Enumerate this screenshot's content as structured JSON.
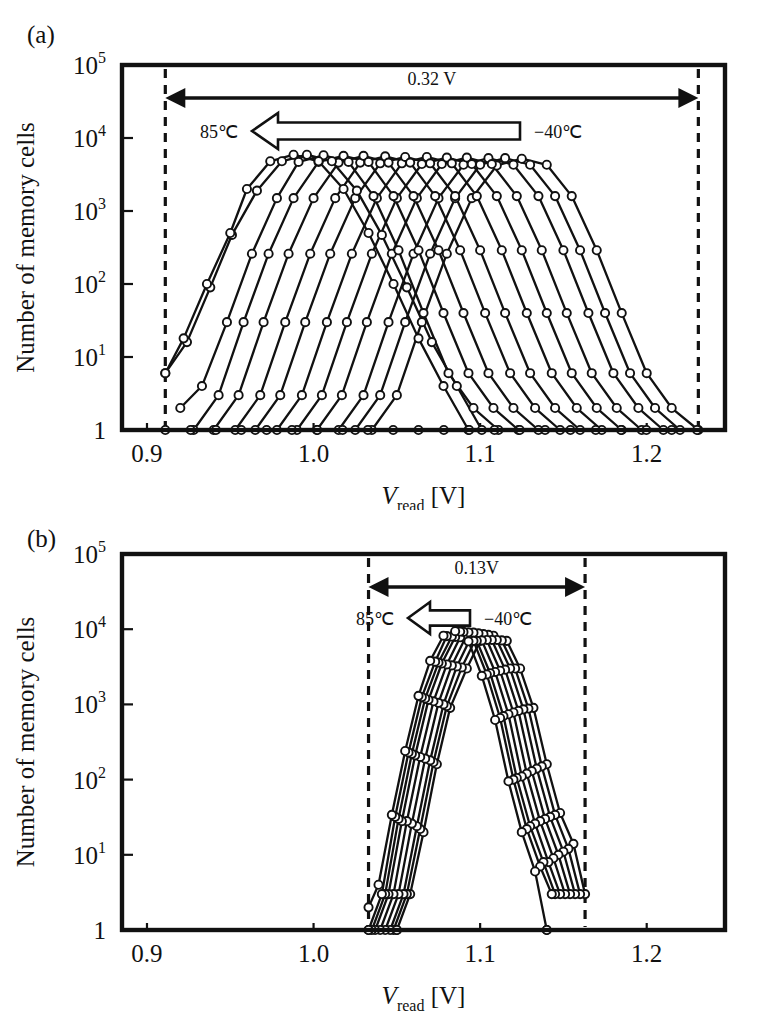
{
  "figure": {
    "panels": [
      {
        "letter": "(a)",
        "name": "panel-a",
        "axes": {
          "xlabel_main": "V",
          "xlabel_sub": "read",
          "xlabel_unit": " [V]",
          "ylabel": "Number of memory cells",
          "xticks": [
            "0.9",
            "1.0",
            "1.1",
            "1.2"
          ],
          "xtick_values": [
            0.9,
            1.0,
            1.1,
            1.2
          ],
          "xlim": [
            0.885,
            1.247
          ],
          "yticks": [
            "1",
            "10",
            "10",
            "10",
            "10",
            "10"
          ],
          "ytick_exponents": [
            "",
            "1",
            "2",
            "3",
            "4",
            "5"
          ],
          "ytick_values": [
            1,
            10,
            100,
            1000,
            10000,
            100000
          ],
          "ylim": [
            1,
            100000
          ],
          "grid": false
        },
        "annotations": {
          "span_label": "0.32 V",
          "span_from": 0.911,
          "span_to": 1.231,
          "temp_left": "85℃",
          "temp_right": "−40℃",
          "dashed_lines": [
            0.911,
            1.231
          ]
        }
      },
      {
        "letter": "(b)",
        "name": "panel-b",
        "axes": {
          "xlabel_main": "V",
          "xlabel_sub": "read",
          "xlabel_unit": " [V]",
          "ylabel": "Number of memory cells",
          "xticks": [
            "0.9",
            "1.0",
            "1.1",
            "1.2"
          ],
          "xtick_values": [
            0.9,
            1.0,
            1.1,
            1.2
          ],
          "xlim": [
            0.885,
            1.247
          ],
          "yticks": [
            "1",
            "10",
            "10",
            "10",
            "10",
            "10"
          ],
          "ytick_exponents": [
            "",
            "1",
            "2",
            "3",
            "4",
            "5"
          ],
          "ytick_values": [
            1,
            10,
            100,
            1000,
            10000,
            100000
          ],
          "ylim": [
            1,
            100000
          ],
          "grid": false
        },
        "annotations": {
          "span_label": "0.13V",
          "span_from": 1.033,
          "span_to": 1.163,
          "temp_left": "85℃",
          "temp_right": "−40℃",
          "dashed_lines": [
            1.033,
            1.163
          ]
        }
      }
    ]
  },
  "chart_data": [
    {
      "type": "line",
      "panel": "(a)",
      "title": "",
      "xlabel": "Vread [V]",
      "ylabel": "Number of memory cells",
      "xlim": [
        0.885,
        1.247
      ],
      "ylim": [
        1,
        100000
      ],
      "yscale": "log",
      "grid": false,
      "legend": "none",
      "marker": "open-circle",
      "annotation_span_V": 0.32,
      "temperature_sweep": [
        "-40℃",
        "85℃"
      ],
      "note": "Read-voltage distributions of memory cells at temperatures swept from -40℃ (right) to 85℃ (left); no temperature compensation.",
      "series": [
        {
          "name": "-40℃",
          "peak_V": 1.125,
          "sigma_V": 0.0335,
          "x": [
            1.035,
            1.05,
            1.065,
            1.08,
            1.095,
            1.11,
            1.125,
            1.14,
            1.155,
            1.17,
            1.185,
            1.2,
            1.215,
            1.231
          ],
          "y": [
            1,
            3,
            30,
            260,
            1500,
            4200,
            5200,
            4300,
            1600,
            290,
            40,
            6,
            2,
            1
          ]
        },
        {
          "name": "-30℃",
          "peak_V": 1.115,
          "sigma_V": 0.0335,
          "x": [
            1.025,
            1.04,
            1.055,
            1.07,
            1.085,
            1.1,
            1.115,
            1.13,
            1.145,
            1.16,
            1.175,
            1.19,
            1.205,
            1.22
          ],
          "y": [
            1,
            3,
            30,
            260,
            1500,
            4300,
            5300,
            4300,
            1600,
            290,
            40,
            6,
            2,
            1
          ]
        },
        {
          "name": "-20℃",
          "peak_V": 1.105,
          "sigma_V": 0.0335,
          "x": [
            1.015,
            1.03,
            1.045,
            1.06,
            1.075,
            1.09,
            1.105,
            1.12,
            1.135,
            1.15,
            1.165,
            1.18,
            1.195,
            1.21
          ],
          "y": [
            1,
            3,
            30,
            260,
            1500,
            4300,
            5300,
            4300,
            1600,
            290,
            40,
            6,
            2,
            1
          ]
        },
        {
          "name": "-10℃",
          "peak_V": 1.092,
          "sigma_V": 0.0335,
          "x": [
            1.002,
            1.017,
            1.032,
            1.047,
            1.062,
            1.077,
            1.092,
            1.107,
            1.122,
            1.137,
            1.152,
            1.167,
            1.182,
            1.197
          ],
          "y": [
            1,
            3,
            30,
            260,
            1500,
            4400,
            5400,
            4400,
            1600,
            290,
            40,
            6,
            2,
            1
          ]
        },
        {
          "name": "0℃",
          "peak_V": 1.08,
          "sigma_V": 0.0335,
          "x": [
            0.99,
            1.005,
            1.02,
            1.035,
            1.05,
            1.065,
            1.08,
            1.095,
            1.11,
            1.125,
            1.14,
            1.155,
            1.17,
            1.185
          ],
          "y": [
            1,
            3,
            30,
            260,
            1500,
            4400,
            5400,
            4400,
            1600,
            290,
            40,
            6,
            2,
            1
          ]
        },
        {
          "name": "10℃",
          "peak_V": 1.068,
          "sigma_V": 0.0335,
          "x": [
            0.978,
            0.993,
            1.008,
            1.023,
            1.038,
            1.053,
            1.068,
            1.083,
            1.098,
            1.113,
            1.128,
            1.143,
            1.158,
            1.173
          ],
          "y": [
            1,
            3,
            30,
            260,
            1500,
            4500,
            5500,
            4500,
            1600,
            290,
            40,
            6,
            2,
            1
          ]
        },
        {
          "name": "20℃",
          "peak_V": 1.055,
          "sigma_V": 0.0335,
          "x": [
            0.965,
            0.98,
            0.995,
            1.01,
            1.025,
            1.04,
            1.055,
            1.07,
            1.085,
            1.1,
            1.115,
            1.13,
            1.145,
            1.16
          ],
          "y": [
            1,
            3,
            30,
            260,
            1500,
            4500,
            5500,
            4500,
            1600,
            290,
            40,
            6,
            2,
            1
          ]
        },
        {
          "name": "30℃",
          "peak_V": 1.043,
          "sigma_V": 0.0335,
          "x": [
            0.953,
            0.968,
            0.983,
            0.998,
            1.013,
            1.028,
            1.043,
            1.058,
            1.073,
            1.088,
            1.103,
            1.118,
            1.133,
            1.148
          ],
          "y": [
            1,
            3,
            30,
            260,
            1500,
            4600,
            5600,
            4600,
            1600,
            290,
            40,
            6,
            2,
            1
          ]
        },
        {
          "name": "40℃",
          "peak_V": 1.03,
          "sigma_V": 0.0335,
          "x": [
            0.94,
            0.955,
            0.97,
            0.985,
            1.0,
            1.015,
            1.03,
            1.045,
            1.06,
            1.075,
            1.09,
            1.105,
            1.12,
            1.135
          ],
          "y": [
            1,
            3,
            30,
            260,
            1500,
            4600,
            5700,
            4600,
            1600,
            290,
            40,
            6,
            2,
            1
          ]
        },
        {
          "name": "50℃",
          "peak_V": 1.018,
          "sigma_V": 0.0335,
          "x": [
            0.928,
            0.943,
            0.958,
            0.973,
            0.988,
            1.003,
            1.018,
            1.033,
            1.048,
            1.063,
            1.078,
            1.093,
            1.108,
            1.123
          ],
          "y": [
            1,
            3,
            30,
            260,
            1500,
            4700,
            5700,
            4700,
            1600,
            290,
            40,
            6,
            2,
            1
          ]
        },
        {
          "name": "60℃",
          "peak_V": 1.006,
          "sigma_V": 0.0335,
          "x": [
            0.92,
            0.933,
            0.948,
            0.963,
            0.978,
            0.991,
            1.006,
            1.021,
            1.036,
            1.051,
            1.066,
            1.081,
            1.096,
            1.111
          ],
          "y": [
            2,
            4,
            30,
            260,
            1500,
            4700,
            5800,
            4700,
            1600,
            290,
            40,
            6,
            2,
            1
          ]
        },
        {
          "name": "70℃",
          "peak_V": 0.996,
          "sigma_V": 0.0335,
          "x": [
            0.911,
            0.924,
            0.938,
            0.951,
            0.966,
            0.981,
            0.996,
            1.011,
            1.026,
            1.041,
            1.056,
            1.071,
            1.086,
            1.101
          ],
          "y": [
            6,
            16,
            90,
            470,
            1900,
            4800,
            5900,
            4800,
            1900,
            470,
            90,
            16,
            4,
            1
          ]
        },
        {
          "name": "85℃",
          "peak_V": 0.988,
          "sigma_V": 0.0335,
          "x": [
            0.911,
            0.922,
            0.936,
            0.95,
            0.96,
            0.974,
            0.988,
            1.003,
            1.018,
            1.033,
            1.048,
            1.063,
            1.078,
            1.093
          ],
          "y": [
            6,
            18,
            100,
            500,
            2000,
            4800,
            5900,
            4800,
            2000,
            500,
            100,
            18,
            4,
            1
          ]
        }
      ]
    },
    {
      "type": "line",
      "panel": "(b)",
      "title": "",
      "xlabel": "Vread [V]",
      "ylabel": "Number of memory cells",
      "xlim": [
        0.885,
        1.247
      ],
      "ylim": [
        1,
        100000
      ],
      "yscale": "log",
      "grid": false,
      "legend": "none",
      "marker": "open-circle",
      "annotation_span_V": 0.13,
      "temperature_sweep": [
        "-40℃",
        "85℃"
      ],
      "note": "Read-voltage distributions with temperature compensation; spread reduced from 0.32 V to 0.13 V.",
      "series": [
        {
          "name": "-40℃",
          "peak_V": 1.108,
          "sigma_V": 0.0165,
          "x": [
            1.05,
            1.058,
            1.066,
            1.074,
            1.082,
            1.092,
            1.1,
            1.108,
            1.116,
            1.124,
            1.132,
            1.14,
            1.148,
            1.156,
            1.163
          ],
          "y": [
            1,
            3,
            20,
            160,
            900,
            3000,
            7000,
            8200,
            7000,
            3000,
            900,
            160,
            36,
            14,
            3
          ]
        },
        {
          "name": "-25℃",
          "peak_V": 1.105,
          "sigma_V": 0.0165,
          "x": [
            1.048,
            1.056,
            1.064,
            1.072,
            1.08,
            1.089,
            1.097,
            1.105,
            1.113,
            1.121,
            1.129,
            1.137,
            1.145,
            1.153,
            1.16
          ],
          "y": [
            1,
            3,
            22,
            170,
            950,
            3100,
            7200,
            8400,
            7100,
            3000,
            880,
            150,
            34,
            12,
            3
          ]
        },
        {
          "name": "-10℃",
          "peak_V": 1.102,
          "sigma_V": 0.0165,
          "x": [
            1.046,
            1.054,
            1.062,
            1.07,
            1.078,
            1.086,
            1.094,
            1.102,
            1.11,
            1.118,
            1.126,
            1.134,
            1.142,
            1.15,
            1.157
          ],
          "y": [
            1,
            3,
            24,
            180,
            1000,
            3200,
            7400,
            8600,
            7200,
            3000,
            860,
            140,
            32,
            11,
            3
          ]
        },
        {
          "name": "5℃",
          "peak_V": 1.099,
          "sigma_V": 0.0165,
          "x": [
            1.043,
            1.051,
            1.059,
            1.067,
            1.075,
            1.083,
            1.091,
            1.099,
            1.107,
            1.115,
            1.123,
            1.131,
            1.139,
            1.147,
            1.154
          ],
          "y": [
            1,
            3,
            26,
            190,
            1050,
            3300,
            7600,
            8800,
            7200,
            2900,
            820,
            130,
            30,
            10,
            3
          ]
        },
        {
          "name": "20℃",
          "peak_V": 1.096,
          "sigma_V": 0.016,
          "x": [
            1.04,
            1.048,
            1.056,
            1.064,
            1.072,
            1.08,
            1.088,
            1.096,
            1.104,
            1.112,
            1.12,
            1.128,
            1.136,
            1.144,
            1.151
          ],
          "y": [
            1,
            3,
            28,
            200,
            1100,
            3400,
            7800,
            9000,
            7200,
            2800,
            780,
            120,
            28,
            9,
            3
          ]
        },
        {
          "name": "35℃",
          "peak_V": 1.093,
          "sigma_V": 0.016,
          "x": [
            1.037,
            1.045,
            1.053,
            1.061,
            1.069,
            1.077,
            1.085,
            1.093,
            1.101,
            1.109,
            1.117,
            1.125,
            1.133,
            1.141,
            1.148
          ],
          "y": [
            1,
            3,
            28,
            210,
            1150,
            3500,
            7900,
            9100,
            7100,
            2700,
            740,
            110,
            26,
            8,
            3
          ]
        },
        {
          "name": "50℃",
          "peak_V": 1.09,
          "sigma_V": 0.016,
          "x": [
            1.035,
            1.043,
            1.051,
            1.059,
            1.067,
            1.075,
            1.083,
            1.09,
            1.098,
            1.106,
            1.114,
            1.122,
            1.13,
            1.138,
            1.145
          ],
          "y": [
            1,
            3,
            30,
            220,
            1200,
            3600,
            8000,
            9200,
            7000,
            2600,
            700,
            105,
            24,
            8,
            3
          ]
        },
        {
          "name": "65℃",
          "peak_V": 1.088,
          "sigma_V": 0.016,
          "x": [
            1.033,
            1.041,
            1.049,
            1.057,
            1.065,
            1.073,
            1.08,
            1.088,
            1.096,
            1.104,
            1.112,
            1.12,
            1.128,
            1.136,
            1.143
          ],
          "y": [
            1,
            3,
            32,
            230,
            1250,
            3700,
            8100,
            9300,
            7000,
            2500,
            660,
            100,
            22,
            7,
            3
          ]
        },
        {
          "name": "85℃",
          "peak_V": 1.085,
          "sigma_V": 0.016,
          "x": [
            1.033,
            1.039,
            1.047,
            1.055,
            1.063,
            1.07,
            1.078,
            1.085,
            1.093,
            1.101,
            1.109,
            1.117,
            1.125,
            1.133,
            1.14
          ],
          "y": [
            2,
            4,
            34,
            240,
            1300,
            3800,
            8200,
            9400,
            6900,
            2400,
            620,
            95,
            20,
            6,
            1
          ]
        }
      ]
    }
  ]
}
